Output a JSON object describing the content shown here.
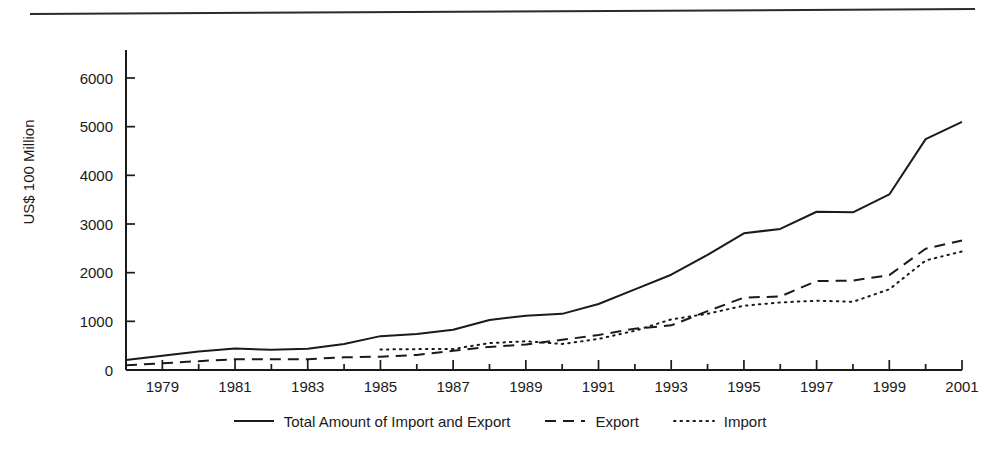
{
  "chart_data": {
    "type": "line",
    "title": "",
    "xlabel": "",
    "ylabel": "US$ 100 Million",
    "xlim": [
      1978,
      2001
    ],
    "ylim": [
      0,
      6500
    ],
    "ytick_values": [
      0,
      1000,
      2000,
      3000,
      4000,
      5000,
      6000
    ],
    "ytick_labels": [
      "0",
      "1000",
      "2000",
      "3000",
      "4000",
      "5000",
      "6000"
    ],
    "xtick_values": [
      1979,
      1981,
      1983,
      1985,
      1987,
      1989,
      1991,
      1993,
      1995,
      1997,
      1999,
      2001
    ],
    "xtick_labels": [
      "1979",
      "1981",
      "1983",
      "1985",
      "1987",
      "1989",
      "1991",
      "1993",
      "1995",
      "1997",
      "1999",
      "2001"
    ],
    "minor_xticks_every_year": true,
    "grid": false,
    "legend_position": "bottom-center",
    "x": [
      1978,
      1979,
      1980,
      1981,
      1982,
      1983,
      1984,
      1985,
      1986,
      1987,
      1988,
      1989,
      1990,
      1991,
      1992,
      1993,
      1994,
      1995,
      1996,
      1997,
      1998,
      1999,
      2000,
      2001
    ],
    "series": [
      {
        "name": "Total Amount of Import and Export",
        "style": "solid",
        "x": [
          1978,
          1979,
          1980,
          1981,
          1982,
          1983,
          1984,
          1985,
          1986,
          1987,
          1988,
          1989,
          1990,
          1991,
          1992,
          1993,
          1994,
          1995,
          1996,
          1997,
          1998,
          1999,
          2000,
          2001
        ],
        "values": [
          206,
          293,
          378,
          440,
          416,
          436,
          535,
          696,
          738,
          827,
          1028,
          1117,
          1154,
          1357,
          1656,
          1958,
          2367,
          2809,
          2899,
          3252,
          3240,
          3607,
          4743,
          5098
        ]
      },
      {
        "name": "Export",
        "style": "dashed",
        "x": [
          1978,
          1979,
          1980,
          1981,
          1982,
          1983,
          1984,
          1985,
          1986,
          1987,
          1988,
          1989,
          1990,
          1991,
          1992,
          1993,
          1994,
          1995,
          1996,
          1997,
          1998,
          1999,
          2000,
          2001
        ],
        "values": [
          98,
          137,
          182,
          220,
          223,
          222,
          261,
          274,
          309,
          394,
          475,
          525,
          621,
          719,
          850,
          917,
          1210,
          1488,
          1511,
          1828,
          1838,
          1949,
          2492,
          2661
        ]
      },
      {
        "name": "Import",
        "style": "dotted",
        "x": [
          1985,
          1986,
          1987,
          1988,
          1989,
          1990,
          1991,
          1992,
          1993,
          1994,
          1995,
          1996,
          1997,
          1998,
          1999,
          2000,
          2001
        ],
        "values": [
          422,
          429,
          432,
          553,
          591,
          534,
          638,
          806,
          1040,
          1156,
          1321,
          1388,
          1424,
          1402,
          1658,
          2251,
          2436
        ]
      }
    ]
  },
  "legend": {
    "items": [
      {
        "label": "Total Amount of Import and Export",
        "style": "solid"
      },
      {
        "label": "Export",
        "style": "dashed"
      },
      {
        "label": "Import",
        "style": "dotted"
      }
    ]
  },
  "colors": {
    "ink": "#1a1a1a",
    "rule": "#2b2b2b",
    "background": "#ffffff"
  }
}
